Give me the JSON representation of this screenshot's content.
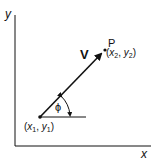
{
  "diagram": {
    "axes": {
      "x_label": "x",
      "y_label": "y"
    },
    "vector": {
      "label": "V",
      "angle_label": "ϕ"
    },
    "start_point": {
      "label_open": "(",
      "x": "x",
      "x_sub": "1",
      "sep": ", ",
      "y": "y",
      "y_sub": "1",
      "label_close": ")"
    },
    "end_point": {
      "name": "P",
      "label_open": "(",
      "x": "x",
      "x_sub": "2",
      "sep": ", ",
      "y": "y",
      "y_sub": "2",
      "label_close": ")"
    },
    "colors": {
      "stroke": "#111111",
      "background": "#ffffff"
    }
  }
}
